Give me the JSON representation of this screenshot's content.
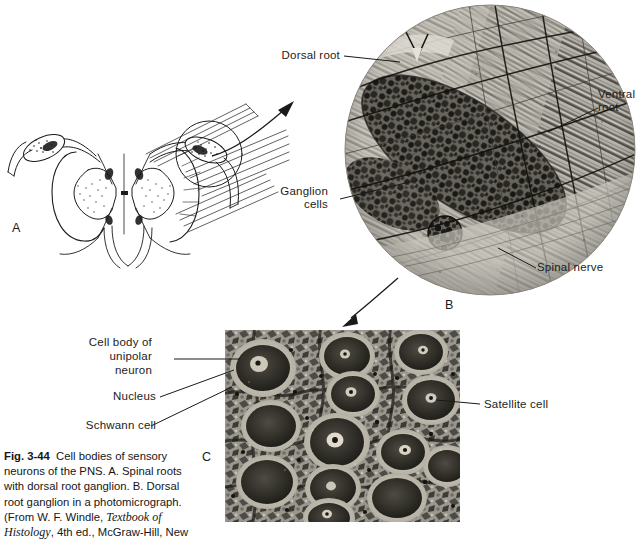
{
  "figure": {
    "id": "Fig. 3-44",
    "caption_lines": [
      "Cell bodies of sensory",
      "neurons of the PNS. A. Spinal roots",
      "with dorsal root ganglion. B. Dorsal",
      "root ganglion in a photomicrograph.",
      "(From W. F. Windle, ",
      "Histology",
      ", 4th ed., McGraw-Hill, New"
    ],
    "caption_fig_label": "Fig. 3-44",
    "caption_part1": "Cell bodies of sensory",
    "caption_part2": "neurons of the PNS. A. Spinal roots",
    "caption_part3": "with dorsal root ganglion. B. Dorsal",
    "caption_part4": "root ganglion in a photomicrograph.",
    "caption_part5a": "(From W. F. Windle, ",
    "caption_part5b": "Textbook of",
    "caption_part6a": "Histology",
    "caption_part6b": ", 4th ed., McGraw-Hill, New"
  },
  "panels": {
    "a": {
      "letter": "A",
      "kind": "line-drawing",
      "description": "Spinal cord segment with dorsal root ganglia and spinal roots"
    },
    "b": {
      "letter": "B",
      "kind": "circular-photomicrograph",
      "description": "Dorsal root ganglion photomicrograph, circular field"
    },
    "c": {
      "letter": "C",
      "kind": "rectangular-photomicrograph",
      "description": "High magnification of ganglion cell bodies"
    }
  },
  "labels": {
    "dorsal_root": "Dorsal root",
    "ventral_root_line1": "Ventral",
    "ventral_root_line2": "root",
    "ganglion_cells_line1": "Ganglion",
    "ganglion_cells_line2": "cells",
    "spinal_nerve": "Spinal nerve",
    "cell_body_line1": "Cell body of",
    "cell_body_line2": "unipolar",
    "cell_body_line3": "neuron",
    "nucleus": "Nucleus",
    "schwann_cell": "Schwann cell",
    "satellite_cell": "Satellite cell"
  },
  "colors": {
    "ink": "#1a1a1a",
    "page": "#ffffff",
    "micrograph_mid": "#8e8e8e",
    "micrograph_dark": "#2b2b2b",
    "micrograph_light": "#d8d8d4"
  }
}
